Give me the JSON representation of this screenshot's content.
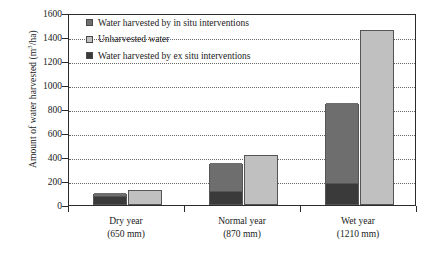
{
  "chart_data": {
    "type": "bar",
    "title": "",
    "xlabel": "",
    "ylabel": "Amount of water harvested (m3/ha)",
    "ylabel_parts": {
      "pre": "Amount of water harvested (m",
      "sup": "3",
      "post": "/ha)"
    },
    "categories": [
      "Dry year",
      "Normal year",
      "Wet year"
    ],
    "category_sublabels": [
      "(650 mm)",
      "(870 mm)",
      "(1210 mm)"
    ],
    "ylim": [
      0,
      1600
    ],
    "yticks": [
      0,
      200,
      400,
      600,
      800,
      1000,
      1200,
      1400,
      1600
    ],
    "ytick_labels": [
      "0",
      "200",
      "400",
      "600",
      "800",
      "1000",
      "1200",
      "1400",
      "1600"
    ],
    "grid": true,
    "grid_style": "dotted",
    "legend_position": "top-left-inside",
    "stacked": true,
    "series": [
      {
        "name": "Water harvested by ex situ interventions",
        "color": "#3a3a3a",
        "stack": "harvested",
        "values": [
          60,
          100,
          170
        ]
      },
      {
        "name": "Water harvested by in situ interventions",
        "color": "#6e6e6e",
        "stack": "harvested",
        "values": [
          35,
          240,
          675
        ]
      },
      {
        "name": "Unharvested water",
        "color": "#c0c0c0",
        "stack": "unharvested",
        "values": [
          125,
          420,
          1460
        ]
      }
    ],
    "stack_totals": {
      "harvested": [
        95,
        340,
        845
      ],
      "unharvested": [
        125,
        420,
        1460
      ]
    },
    "legend": [
      {
        "label": "Water harvested by in situ interventions",
        "color": "#6e6e6e"
      },
      {
        "label": "Unharvested water",
        "color": "#c0c0c0"
      },
      {
        "label": "Water harvested by ex situ interventions",
        "color": "#3a3a3a"
      }
    ]
  },
  "colors": {
    "axis": "#2b2b2b",
    "grid": "#666666",
    "background": "#ffffff",
    "in_situ": "#6e6e6e",
    "ex_situ": "#3a3a3a",
    "unharvested": "#c0c0c0"
  }
}
